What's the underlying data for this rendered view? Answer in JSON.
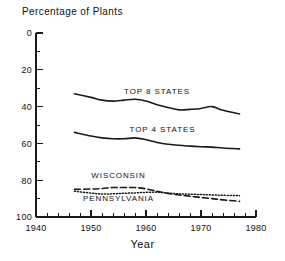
{
  "chart_data": {
    "type": "line",
    "title": "Percentage of Plants",
    "xlabel": "Year",
    "ylabel": "",
    "xlim": [
      1940,
      1980
    ],
    "ylim": [
      0,
      100
    ],
    "grid": false,
    "legend_position": "inline-annotations",
    "x_ticks_major": [
      1940,
      1950,
      1960,
      1970,
      1980
    ],
    "x_ticks_minor_step": 2,
    "y_ticks_major": [
      0,
      20,
      40,
      60,
      80,
      100
    ],
    "y_ticks_minor_step": 10,
    "x": [
      1947,
      1950,
      1952,
      1954,
      1956,
      1958,
      1960,
      1962,
      1964,
      1966,
      1968,
      1970,
      1972,
      1974,
      1977
    ],
    "series": [
      {
        "name": "TOP 8 STATES",
        "style": "solid",
        "label_x": 1962,
        "label_y": 67,
        "values": [
          67,
          65,
          63.5,
          63,
          63.5,
          64,
          63,
          61,
          59.5,
          58.2,
          58.5,
          59,
          60,
          58,
          56
        ]
      },
      {
        "name": "TOP 4 STATES",
        "style": "solid",
        "label_x": 1963,
        "label_y": 46,
        "values": [
          46,
          44,
          43,
          42.5,
          42.5,
          43,
          42,
          40.5,
          39.5,
          39,
          38.5,
          38.2,
          38,
          37.5,
          37
        ]
      },
      {
        "name": "WISCONSIN",
        "style": "dashed",
        "label_x": 1955,
        "label_y": 21,
        "values": [
          15,
          15.2,
          15.5,
          16,
          16,
          16,
          15.3,
          14,
          12.8,
          12,
          11.3,
          10.6,
          10,
          9.3,
          8.5
        ]
      },
      {
        "name": "PENNSYLVANIA",
        "style": "dotted",
        "label_x": 1955,
        "label_y": 8.5,
        "values": [
          14,
          13,
          12.5,
          12.6,
          12.9,
          13.1,
          13.4,
          13.5,
          13,
          12.6,
          12.4,
          12.2,
          12,
          11.8,
          11.6
        ]
      }
    ]
  },
  "axes": {
    "y_tick_labels": [
      "100",
      "80",
      "60",
      "40",
      "20",
      "0"
    ],
    "x_tick_labels": [
      "1940",
      "1950",
      "1960",
      "1970",
      "1980"
    ]
  },
  "labels": {
    "title": "Percentage of Plants",
    "x_axis_title": "Year",
    "series_top8": "TOP 8 STATES",
    "series_top4": "TOP 4 STATES",
    "series_wisconsin": "WISCONSIN",
    "series_pennsylvania": "PENNSYLVANIA"
  }
}
